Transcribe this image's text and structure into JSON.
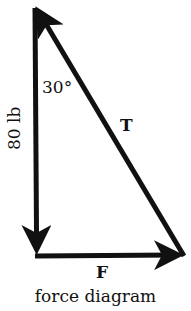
{
  "diagram": {
    "title": "force diagram",
    "type": "force triangle",
    "vectors": [
      {
        "id": "weight",
        "label": "80 lb",
        "direction": "down",
        "from": [
          35,
          6
        ],
        "to": [
          37,
          256
        ]
      },
      {
        "id": "horizontal",
        "label": "F",
        "direction": "right",
        "from": [
          37,
          256
        ],
        "to": [
          184,
          255
        ]
      },
      {
        "id": "tension",
        "label": "T",
        "direction": "up-left",
        "from": [
          184,
          255
        ],
        "to": [
          35,
          6
        ]
      }
    ],
    "angle": {
      "label": "30°",
      "vertex": "top"
    },
    "colors": {
      "stroke": "#111111",
      "background": "#ffffff"
    }
  },
  "labels": {
    "angle": "30°",
    "weight": "80 lb",
    "tension": "T",
    "force": "F",
    "caption": "force diagram"
  }
}
